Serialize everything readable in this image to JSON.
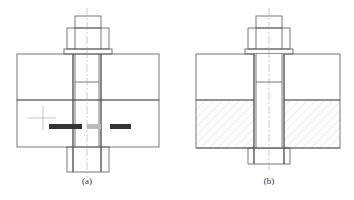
{
  "figure": {
    "panels": [
      {
        "id": "a",
        "caption": "(a)",
        "description": "Bolt joint with cursor and dynamic input tooltip over lower plate",
        "tooltip": {
          "segments": [
            "",
            "",
            ""
          ]
        }
      },
      {
        "id": "b",
        "caption": "(b)",
        "description": "Bolt joint with lower plate hatched"
      }
    ],
    "colors": {
      "line": "#555555",
      "hatch": "#c8c8c8",
      "tooltip_bg": "#333333",
      "tooltip_light": "#bbbbbb"
    }
  }
}
